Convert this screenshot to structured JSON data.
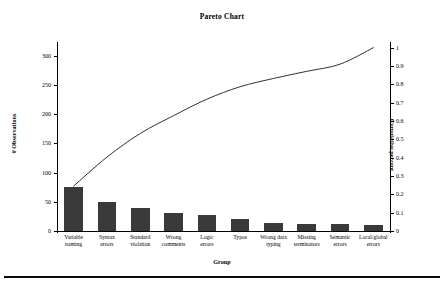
{
  "chart_data": {
    "type": "bar",
    "title": "Pareto Chart",
    "xlabel": "Group",
    "ylabel": "# Observations",
    "y2label": "Cumulative percent",
    "grid": false,
    "legend": "none",
    "ylim": [
      0,
      320
    ],
    "y2lim": [
      0,
      1.02
    ],
    "categories": [
      "Variable naming",
      "Syntax errors",
      "Standard violation",
      "Wrong comments",
      "Logic errors",
      "Typos",
      "Wrong data typing",
      "Missing terminators",
      "Semantic errors",
      "Local/global errors"
    ],
    "category_lines": [
      [
        "Variable",
        "naming"
      ],
      [
        "Syntax",
        "errors"
      ],
      [
        "Standard",
        "violation"
      ],
      [
        "Wrong",
        "comments"
      ],
      [
        "Logic",
        "errors"
      ],
      [
        "Typos",
        ""
      ],
      [
        "Wrong data",
        "typing"
      ],
      [
        "Missing",
        "terminators"
      ],
      [
        "Semantic",
        "errors"
      ],
      [
        "Local/global",
        "errors"
      ]
    ],
    "series": [
      {
        "name": "# Observations",
        "type": "bar",
        "color": "#3a3a3a",
        "values": [
          76,
          49,
          40,
          30,
          28,
          21,
          14,
          12,
          12,
          10
        ]
      },
      {
        "name": "Cumulative percent",
        "type": "line",
        "axis": "right",
        "color": "#1a1a1a",
        "values": [
          0.245,
          0.403,
          0.532,
          0.629,
          0.719,
          0.787,
          0.832,
          0.871,
          0.91,
          1.0
        ]
      }
    ],
    "yticks": [
      0,
      50,
      100,
      150,
      200,
      250,
      300
    ],
    "y2ticks": [
      "0",
      "0.1",
      "0.2",
      "0.3",
      "0.4",
      "0.5",
      "0.6",
      "0.7",
      "0.8",
      "0.9",
      "1"
    ],
    "y2tick_values": [
      0,
      0.1,
      0.2,
      0.3,
      0.4,
      0.5,
      0.6,
      0.7,
      0.8,
      0.9,
      1
    ]
  }
}
